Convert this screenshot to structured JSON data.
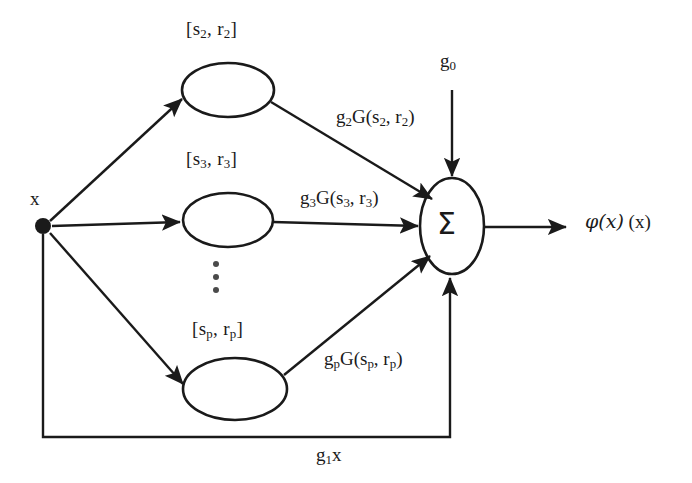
{
  "diagram": {
    "background_color": "#ffffff",
    "stroke_color": "#1a1a1a",
    "input": {
      "label": "x",
      "node_type": "filled-dot",
      "x": 43,
      "y": 225
    },
    "hidden_nodes": [
      {
        "id": "node-2",
        "label_prefix": "[s",
        "label_sub": "2",
        "label_mid": ", r",
        "label_sub2": "2",
        "label_suffix": "]",
        "label_text": "[s2, r2]",
        "cx": 228,
        "cy": 90
      },
      {
        "id": "node-3",
        "label_prefix": "[s",
        "label_sub": "3",
        "label_mid": ", r",
        "label_sub2": "3",
        "label_suffix": "]",
        "label_text": "[s3, r3]",
        "cx": 228,
        "cy": 220
      },
      {
        "id": "node-p",
        "label_prefix": "[s",
        "label_sub": "p",
        "label_mid": ", r",
        "label_sub2": "p",
        "label_suffix": "]",
        "label_text": "[sp, rp]",
        "cx": 235,
        "cy": 389
      }
    ],
    "ellipsis": {
      "symbol": "vertical-ellipsis",
      "dots": 3
    },
    "edge_labels": [
      {
        "id": "weight-2",
        "prefix": "g",
        "sub": "2",
        "suffix": "G(s",
        "sub2": "2",
        "mid": ", r",
        "sub3": "2",
        "end": ")",
        "text": "g2G(s2, r2)"
      },
      {
        "id": "weight-3",
        "prefix": "g",
        "sub": "3",
        "suffix": "G(s",
        "sub2": "3",
        "mid": ", r",
        "sub3": "3",
        "end": ")",
        "text": "g3G(s3, r3)"
      },
      {
        "id": "weight-p",
        "prefix": "g",
        "sub": "p",
        "suffix": "G(s",
        "sub2": "p",
        "mid": ", r",
        "sub3": "p",
        "end": ")",
        "text": "gpG(sp, rp)"
      }
    ],
    "bias": {
      "prefix": "g",
      "sub": "0",
      "text": "g0"
    },
    "feedback": {
      "prefix": "g",
      "sub": "1",
      "suffix": "x",
      "text": "g1x"
    },
    "summation": {
      "symbol": "Σ",
      "cx": 452,
      "cy": 226
    },
    "output": {
      "phi": "φ",
      "arg": "(x)",
      "extra": "(x)",
      "text": "φ(x) (x)"
    }
  }
}
